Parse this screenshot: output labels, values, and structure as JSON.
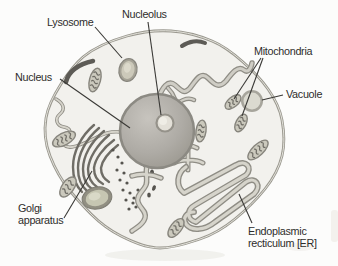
{
  "figure": {
    "type": "labeled-diagram",
    "canvas": {
      "width": 338,
      "height": 266
    },
    "colors": {
      "background": "#fcfcfb",
      "cytoplasm": "#f2f1ed",
      "membrane": "#9a988f",
      "membrane_highlight": "#e3e2db",
      "text": "#2e2d2b",
      "pointer_line": "#3a3936",
      "nucleus_rim": "#8c8a83",
      "nucleus_fill": "#b1aea8",
      "nucleolus_ring": "#95928a",
      "nucleolus_fill": "#e3e0d8",
      "organelle_outline": "#87857d",
      "organelle_fill": "#cbc9bd",
      "cristae": "#6e6c65",
      "golgi": "#6f6d66",
      "tube_outer": "#8f8d85",
      "tube_inner": "#d6d4cb",
      "rod": "#5d5b56",
      "vesicle": "#56544f"
    },
    "labels": [
      {
        "id": "lysosome",
        "text": "Lysosome",
        "x": 47,
        "y": 16,
        "pointer_lines": [
          [
            95,
            27,
            122,
            58
          ]
        ]
      },
      {
        "id": "nucleolus",
        "text": "Nucleolus",
        "x": 122,
        "y": 8,
        "pointer_lines": [
          [
            148,
            22,
            161,
            115
          ]
        ]
      },
      {
        "id": "nucleus",
        "text": "Nucleus",
        "x": 15,
        "y": 71,
        "pointer_lines": [
          [
            60,
            79,
            130,
            128
          ]
        ]
      },
      {
        "id": "mitochondria",
        "text": "Mitochondria",
        "x": 254,
        "y": 45,
        "pointer_lines": [
          [
            261,
            58,
            234,
            99
          ],
          [
            263,
            58,
            242,
            116
          ]
        ]
      },
      {
        "id": "vacuole",
        "text": "Vacuole",
        "x": 286,
        "y": 88,
        "pointer_lines": [
          [
            283,
            95,
            262,
            100
          ]
        ]
      },
      {
        "id": "golgi-apparatus",
        "text": "Golgi\napparatus",
        "x": 18,
        "y": 202,
        "pointer_lines": [
          [
            64,
            218,
            92,
            171
          ]
        ]
      },
      {
        "id": "endoplasmic-reticulum",
        "text": "Endoplasmic\nrecticulum [ER]",
        "x": 248,
        "y": 225,
        "pointer_lines": [
          [
            252,
            223,
            239,
            194
          ]
        ]
      }
    ],
    "organelles": {
      "nucleus": {
        "cx": 157,
        "cy": 131,
        "r": 37
      },
      "nucleolus": {
        "cx": 165,
        "cy": 123,
        "r": 8.5
      },
      "lysosome": {
        "cx": 128,
        "cy": 70,
        "rx": 9,
        "ry": 11.5,
        "rot": 12
      },
      "vacuole": {
        "cx": 252,
        "cy": 101,
        "r": 11
      },
      "secretory_vesicle": {
        "cx": 97,
        "cy": 198,
        "rx": 15,
        "ry": 11,
        "rot": -12
      },
      "mitochondria": [
        {
          "cx": 95,
          "cy": 80,
          "rot": -75,
          "len": 24,
          "wid": 11
        },
        {
          "cx": 64,
          "cy": 139,
          "rot": -28,
          "len": 25,
          "wid": 12
        },
        {
          "cx": 68,
          "cy": 187,
          "rot": -55,
          "len": 23,
          "wid": 12
        },
        {
          "cx": 233,
          "cy": 102,
          "rot": -40,
          "len": 19,
          "wid": 10
        },
        {
          "cx": 241,
          "cy": 123,
          "rot": -62,
          "len": 19,
          "wid": 10
        },
        {
          "cx": 201,
          "cy": 131,
          "rot": -82,
          "len": 22,
          "wid": 10
        },
        {
          "cx": 258,
          "cy": 150,
          "rot": -44,
          "len": 26,
          "wid": 11
        },
        {
          "cx": 176,
          "cy": 228,
          "rot": -52,
          "len": 22,
          "wid": 11
        }
      ],
      "golgi_vesicles": [
        [
          113,
          150
        ],
        [
          118,
          157
        ],
        [
          122,
          163
        ],
        [
          117,
          170
        ],
        [
          124,
          173
        ],
        [
          120,
          180
        ],
        [
          127,
          183
        ],
        [
          123,
          190
        ],
        [
          130,
          193
        ],
        [
          126,
          200
        ],
        [
          133,
          203
        ],
        [
          129,
          209
        ],
        [
          136,
          207
        ],
        [
          134,
          198
        ],
        [
          138,
          190
        ],
        [
          131,
          175
        ]
      ],
      "dark_granules": [
        [
          148,
          149,
          3,
          5,
          -25
        ],
        [
          154,
          160,
          2.5,
          4.5,
          15
        ],
        [
          146,
          166,
          2.5,
          4,
          -35
        ],
        [
          152,
          173,
          2,
          3.5,
          0
        ],
        [
          147,
          182,
          2,
          3,
          -15
        ],
        [
          154,
          188,
          1.8,
          2.8,
          20
        ],
        [
          149,
          195,
          1.8,
          2.5,
          0
        ]
      ]
    }
  }
}
